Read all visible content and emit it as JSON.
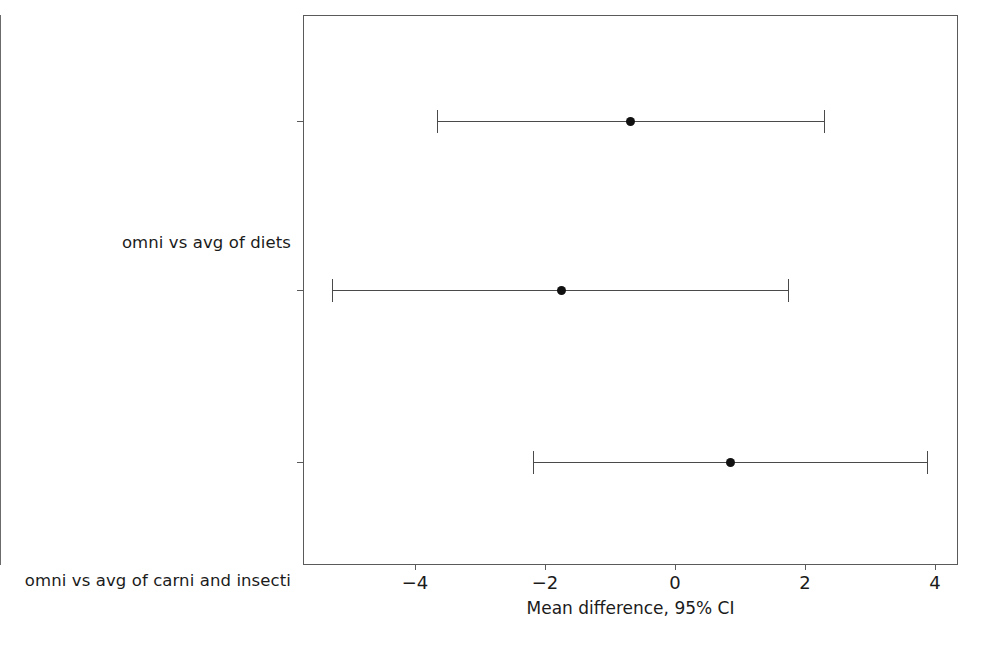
{
  "chart_data": {
    "type": "scatter",
    "subtype": "forest-plot-confidence-intervals",
    "title": "",
    "xlabel": "Mean difference, 95% CI",
    "ylabel": "",
    "xlim": [
      -5.72,
      4.35
    ],
    "xticks": [
      -4,
      -2,
      0,
      2,
      4
    ],
    "xticklabels": [
      "−4",
      "−2",
      "0",
      "2",
      "4"
    ],
    "grid": false,
    "legend": null,
    "reference_line": 0,
    "categories": [
      "omni vs avg of diets",
      "omni vs avg of carni and insecti",
      "carni vs herbi"
    ],
    "points": [
      {
        "label": "omni vs avg of diets",
        "mean": -0.69,
        "ci_low": -3.66,
        "ci_high": 2.29
      },
      {
        "label": "omni vs avg of carni and insecti",
        "mean": -1.75,
        "ci_low": -5.28,
        "ci_high": 1.74
      },
      {
        "label": "carni vs herbi",
        "mean": 0.86,
        "ci_low": -2.18,
        "ci_high": 3.88
      }
    ],
    "colors": {
      "point": "#111111",
      "interval": "#4a4a4a",
      "axis": "#5a5a5a",
      "reference_line": "#6b6b6b",
      "text": "#1b1b1b",
      "background": "#ffffff"
    }
  }
}
